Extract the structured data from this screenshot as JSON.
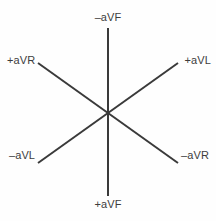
{
  "figure": {
    "name": "hexaxial-reference-system",
    "background_color": "#fefefe",
    "line_color": "#3a3a3a",
    "text_color": "#3d3d3d",
    "line_width": 2
  },
  "axes": [
    {
      "id": "avf-axis",
      "orientation": "vertical",
      "x1": 108,
      "y1": 28,
      "x2": 108,
      "y2": 196,
      "positive_end": "+aVF",
      "negative_end": "–aVF"
    },
    {
      "id": "avr-axis",
      "orientation": "diagonal-nw-se",
      "x1": 38,
      "y1": 63,
      "x2": 178,
      "y2": 163,
      "positive_end": "+aVR",
      "negative_end": "–aVR"
    },
    {
      "id": "avl-axis",
      "orientation": "diagonal-ne-sw",
      "x1": 178,
      "y1": 63,
      "x2": 38,
      "y2": 163,
      "positive_end": "+aVL",
      "negative_end": "–aVL"
    }
  ],
  "center": {
    "x": 108,
    "y": 113
  },
  "labels": {
    "neg_avf": "–aVF",
    "pos_avf": "+aVF",
    "pos_avr": "+aVR",
    "pos_avl": "+aVL",
    "neg_avl": "–aVL",
    "neg_avr": "–aVR"
  },
  "chart_data": {
    "type": "scatter",
    "title": "",
    "xlabel": "",
    "ylabel": "",
    "grid": false,
    "legend": "none",
    "xlim": [
      0,
      216
    ],
    "ylim": [
      0,
      221
    ],
    "origin": {
      "x": 108,
      "y": 113
    },
    "series": [
      {
        "name": "–aVF / +aVF",
        "angle_degrees": 90,
        "points": [
          {
            "x": 108,
            "y": 28,
            "label": "–aVF"
          },
          {
            "x": 108,
            "y": 196,
            "label": "+aVF"
          }
        ]
      },
      {
        "name": "+aVR / –aVR",
        "angle_degrees": 35,
        "points": [
          {
            "x": 38,
            "y": 63,
            "label": "+aVR"
          },
          {
            "x": 178,
            "y": 163,
            "label": "–aVR"
          }
        ]
      },
      {
        "name": "+aVL / –aVL",
        "angle_degrees": 145,
        "points": [
          {
            "x": 178,
            "y": 63,
            "label": "+aVL"
          },
          {
            "x": 38,
            "y": 163,
            "label": "–aVL"
          }
        ]
      }
    ],
    "annotations": [
      {
        "text": "–aVF",
        "x": 108,
        "y": 17,
        "anchor": "center"
      },
      {
        "text": "+aVR",
        "x": 21,
        "y": 60,
        "anchor": "start"
      },
      {
        "text": "+aVL",
        "x": 196,
        "y": 60,
        "anchor": "end"
      },
      {
        "text": "–aVL",
        "x": 23,
        "y": 155,
        "anchor": "start"
      },
      {
        "text": "–aVR",
        "x": 194,
        "y": 155,
        "anchor": "end"
      },
      {
        "text": "+aVF",
        "x": 108,
        "y": 204,
        "anchor": "center"
      }
    ]
  }
}
